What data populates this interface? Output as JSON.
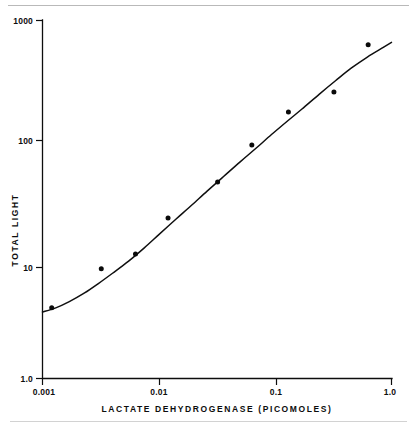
{
  "figure": {
    "background_color": "#ffffff",
    "ink_color": "#0d0d0d",
    "rule_color": "#b9b9b9"
  },
  "caption_partial": "",
  "chart_data": {
    "type": "scatter",
    "title": "",
    "subtitle": "",
    "xlabel": "LACTATE DEHYDROGENASE  (PICOMOLES)",
    "ylabel": "TOTAL LIGHT",
    "xscale": "log",
    "yscale": "log",
    "xlim": [
      0.001,
      1.0
    ],
    "ylim": [
      1.0,
      1000
    ],
    "grid": false,
    "legend": false,
    "legend_position": "none",
    "xticks": [
      0.001,
      0.01,
      0.1,
      1.0
    ],
    "xtick_labels": [
      "0.001",
      "0.01",
      "0.1",
      "1.0"
    ],
    "yticks": [
      1.0,
      10,
      100,
      1000
    ],
    "ytick_labels": [
      "1.0",
      "10",
      "100",
      "1000"
    ],
    "marker": "filled-circle",
    "series": [
      {
        "name": "Total light vs lactate dehydrogenase",
        "x": [
          0.0012,
          0.0032,
          0.0063,
          0.012,
          0.032,
          0.063,
          0.13,
          0.32,
          0.63
        ],
        "y": [
          3.9,
          8.3,
          11.0,
          22.0,
          44.0,
          90.0,
          170.0,
          250.0,
          620.0
        ]
      }
    ],
    "fit_curve": {
      "name": "fitted sigmoid response curve",
      "x": [
        0.001,
        0.0013,
        0.0017,
        0.0023,
        0.003,
        0.004,
        0.0055,
        0.0075,
        0.01,
        0.014,
        0.019,
        0.026,
        0.036,
        0.05,
        0.068,
        0.093,
        0.13,
        0.17,
        0.24,
        0.33,
        0.45,
        0.62,
        0.85,
        1.0
      ],
      "y": [
        3.6,
        3.9,
        4.4,
        5.2,
        6.2,
        7.6,
        9.6,
        12.4,
        16.0,
        21.5,
        28.0,
        37.0,
        49.0,
        65.0,
        84.0,
        110.0,
        145.0,
        180.0,
        240.0,
        310.0,
        395.0,
        490.0,
        590.0,
        650.0
      ]
    }
  }
}
